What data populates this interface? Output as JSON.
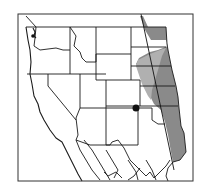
{
  "map": {
    "title": "",
    "region": "Western United States and northern Mexico",
    "legend": [],
    "colors": {
      "background": "#ffffff",
      "range_fill": "#8a8a8a",
      "range_fill_light": "#b0b0b0",
      "border_stroke": "#1a1a1a",
      "marker": "#111111"
    },
    "features": {
      "shaded_range": "Gray distribution band along the Great Plains (Montana/Dakotas south to Texas)",
      "transect_line": "Diagonal line through the shaded band",
      "point_marker": "Black dot at southeastern Colorado / Kansas border area"
    }
  }
}
